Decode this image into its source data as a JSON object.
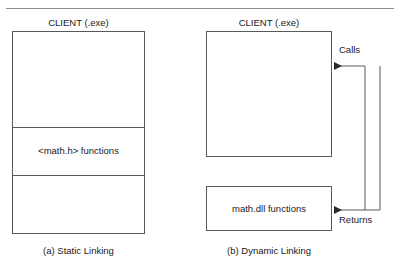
{
  "figure": {
    "title_rule": "horizontal-rule",
    "panels": [
      {
        "id": "static",
        "header": "CLIENT (.exe)",
        "caption": "(a) Static Linking",
        "band_label": "<math.h> functions"
      },
      {
        "id": "dynamic",
        "header": "CLIENT (.exe)",
        "caption": "(b) Dynamic Linking",
        "library_label": "math.dll functions",
        "arrow_calls_label": "Calls",
        "arrow_returns_label": "Returns"
      }
    ]
  },
  "colors": {
    "stroke": "#5a5a5a",
    "rule": "#8b8b8b",
    "text": "#1a1a1a",
    "background": "#ffffff"
  }
}
